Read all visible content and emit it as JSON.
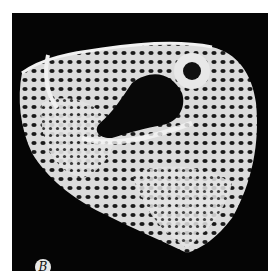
{
  "figure": {
    "panel_label": "B",
    "colors": {
      "background": "#050505",
      "bone": "#e6e6e6",
      "page": "#ffffff"
    }
  }
}
